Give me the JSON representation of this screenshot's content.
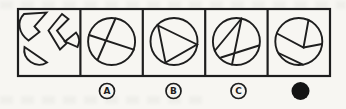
{
  "item": {
    "figures": [
      {
        "name": "question-figure",
        "icon": "scattered-circle-pieces-icon"
      },
      {
        "name": "option-a-figure",
        "icon": "circle-two-crossing-chords-icon"
      },
      {
        "name": "option-b-figure",
        "icon": "circle-inscribed-thin-triangle-icon"
      },
      {
        "name": "option-c-figure",
        "icon": "circle-three-chords-icon"
      },
      {
        "name": "option-d-figure",
        "icon": "circle-assembled-pieces-icon"
      }
    ],
    "options": [
      {
        "label": "A"
      },
      {
        "label": "B"
      },
      {
        "label": "C"
      }
    ],
    "selected_option_marker": "filled-dot"
  },
  "colors": {
    "ink": "#1e1e1e",
    "paper": "#f7f6f2"
  }
}
